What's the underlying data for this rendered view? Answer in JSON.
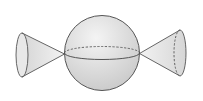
{
  "figure": {
    "title": "",
    "background_color": "#ffffff",
    "stroke_color": "#555555",
    "hidden_edge_style": "dashed",
    "components": [
      {
        "id": "left-cone",
        "type": "cone",
        "orientation": "apex-right",
        "base_visible_edge": "left-half",
        "base_hidden_edge": "none"
      },
      {
        "id": "sphere",
        "type": "sphere",
        "equator_front": "solid",
        "equator_back": "dashed"
      },
      {
        "id": "right-cone",
        "type": "cone",
        "orientation": "apex-left",
        "base_visible_edge": "right-half",
        "base_hidden_edge": "left-half"
      }
    ],
    "colors": {
      "sphere_fill_light": "#f4f4f4",
      "sphere_fill_dark": "#c9c9c9",
      "cone_fill_light": "#f2f2f2",
      "cone_fill_dark": "#d6d6d6",
      "cone_base_fill": "#e8e8e8"
    }
  }
}
